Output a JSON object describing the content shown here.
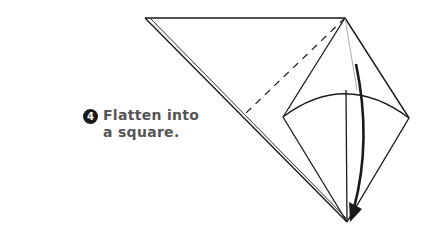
{
  "instruction": {
    "step_number": "4",
    "line1": "Flatten into",
    "line2": "a square."
  },
  "colors": {
    "line": "#1a1a1a",
    "faint_line": "#aaaaaa",
    "text": "#555555",
    "badge": "#1a1a1a"
  }
}
